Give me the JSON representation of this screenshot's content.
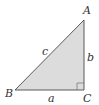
{
  "diagram": {
    "type": "right-triangle",
    "vertices": {
      "A": {
        "label": "A",
        "x": 84,
        "y": 20
      },
      "B": {
        "label": "B",
        "x": 15,
        "y": 90
      },
      "C": {
        "label": "C",
        "x": 84,
        "y": 90
      }
    },
    "sides": {
      "a": {
        "label": "a"
      },
      "b": {
        "label": "b"
      },
      "c": {
        "label": "c"
      }
    },
    "right_angle_at": "C",
    "colors": {
      "fill": "#d9d9d9",
      "stroke": "#555555",
      "text": "#333333"
    }
  }
}
